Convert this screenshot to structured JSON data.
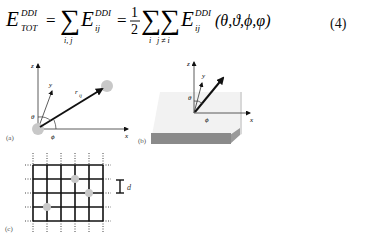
{
  "equation": {
    "lhs": "E",
    "lhs_sup": "DDI",
    "lhs_sub": "TOT",
    "sum1_sub": "i, j",
    "term1": "E",
    "term1_sup": "DDI",
    "term1_sub": "ij",
    "frac_num": "1",
    "frac_den": "2",
    "sum2_sub": "i",
    "sum3_sub": "j ≠ i",
    "term2": "E",
    "term2_sup": "DDI",
    "term2_sub": "ij",
    "args": "(θ,ϑ,ϕ,φ)",
    "number": "(4)"
  },
  "figures": {
    "a": {
      "label": "(a)",
      "axis_z": "z",
      "axis_y": "y",
      "axis_x": "x",
      "vector_label": "r",
      "vector_sub": "ij",
      "theta": "θ",
      "phi": "ϕ"
    },
    "b": {
      "label": "(b)",
      "axis_z": "z",
      "axis_y": "y",
      "axis_x": "x",
      "theta": "θ",
      "phi": "ϕ"
    },
    "c": {
      "label": "(c)",
      "spacing_label": "d"
    }
  },
  "colors": {
    "line": "#111111",
    "dot": "#c8c8c8",
    "slab_top": "#f2f2f2",
    "slab_side": "#8a8a8a"
  }
}
